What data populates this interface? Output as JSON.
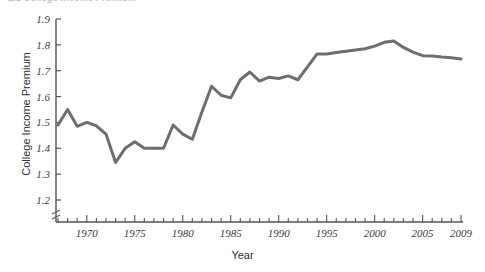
{
  "figure": {
    "top_caption_fragment": "1.1  College Income Premium",
    "x_axis_title": "Year",
    "y_axis_title": "College Income Premium"
  },
  "chart_data": {
    "type": "line",
    "title": "",
    "xlabel": "Year",
    "ylabel": "College Income Premium",
    "xlim": [
      1966.5,
      2009.5
    ],
    "ylim": [
      1.2,
      1.9
    ],
    "y_axis_broken_below_min": true,
    "grid": false,
    "legend": "none",
    "line_color": "#6e6e6e",
    "line_width": 3,
    "y_tick_labels": [
      "1.2",
      "1.3",
      "1.4",
      "1.5",
      "1.6",
      "1.7",
      "1.8",
      "1.9"
    ],
    "y_ticks": [
      1.2,
      1.3,
      1.4,
      1.5,
      1.6,
      1.7,
      1.8,
      1.9
    ],
    "x_tick_labels": [
      "1970",
      "1975",
      "1980",
      "1985",
      "1990",
      "1995",
      "2000",
      "2005",
      "2009"
    ],
    "x_labeled_ticks": [
      1970,
      1975,
      1980,
      1985,
      1990,
      1995,
      2000,
      2005,
      2009
    ],
    "x_minor_tick_interval": 1,
    "x": [
      1967,
      1968,
      1969,
      1970,
      1971,
      1972,
      1973,
      1974,
      1975,
      1976,
      1977,
      1978,
      1979,
      1980,
      1981,
      1982,
      1983,
      1984,
      1985,
      1986,
      1987,
      1988,
      1989,
      1990,
      1991,
      1992,
      1993,
      1994,
      1995,
      1996,
      1997,
      1998,
      1999,
      2000,
      2001,
      2002,
      2003,
      2004,
      2005,
      2006,
      2007,
      2008,
      2009
    ],
    "values": [
      1.49,
      1.55,
      1.485,
      1.5,
      1.487,
      1.455,
      1.345,
      1.4,
      1.425,
      1.4,
      1.4,
      1.4,
      1.49,
      1.455,
      1.435,
      1.54,
      1.64,
      1.605,
      1.595,
      1.665,
      1.695,
      1.66,
      1.675,
      1.67,
      1.68,
      1.665,
      1.715,
      1.765,
      1.765,
      1.77,
      1.775,
      1.78,
      1.785,
      1.795,
      1.81,
      1.815,
      1.79,
      1.772,
      1.758,
      1.757,
      1.753,
      1.75,
      1.745
    ]
  }
}
